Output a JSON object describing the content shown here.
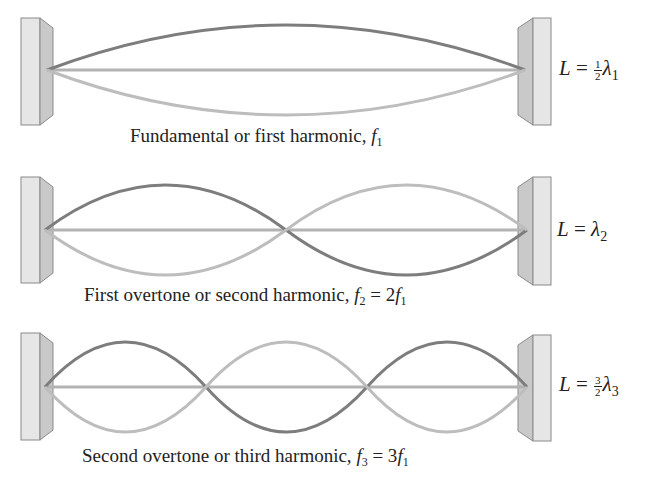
{
  "colors": {
    "wall_light": "#e6e6e6",
    "wall_dark": "#c9c9c9",
    "wall_edge": "#8a8a8a",
    "string_dark": "#7d7d7d",
    "string_light": "#bdbdbd",
    "axis_line": "#b3b3b3",
    "text": "#222222"
  },
  "panels": [
    {
      "name": "first-harmonic",
      "caption_text": "Fundamental or first harmonic, ",
      "caption_f": "f",
      "caption_f_sub": "1",
      "caption_rest": "",
      "caption_rest_sub": "",
      "formula_L": "L",
      "formula_eq": " = ",
      "formula_frac_num": "1",
      "formula_frac_den": "2",
      "formula_lambda": "λ",
      "formula_sub": "1",
      "loops": 1
    },
    {
      "name": "second-harmonic",
      "caption_text": "First overtone or second harmonic, ",
      "caption_f": "f",
      "caption_f_sub": "2",
      "caption_rest": " = 2",
      "caption_rest_f": "f",
      "caption_rest_sub": "1",
      "formula_L": "L",
      "formula_eq": " = ",
      "formula_lambda": "λ",
      "formula_sub": "2",
      "loops": 2
    },
    {
      "name": "third-harmonic",
      "caption_text": "Second overtone or third harmonic, ",
      "caption_f": "f",
      "caption_f_sub": "3",
      "caption_rest": " = 3",
      "caption_rest_f": "f",
      "caption_rest_sub": "1",
      "formula_L": "L",
      "formula_eq": " = ",
      "formula_frac_num": "3",
      "formula_frac_den": "2",
      "formula_lambda": "λ",
      "formula_sub": "3",
      "loops": 3
    }
  ]
}
